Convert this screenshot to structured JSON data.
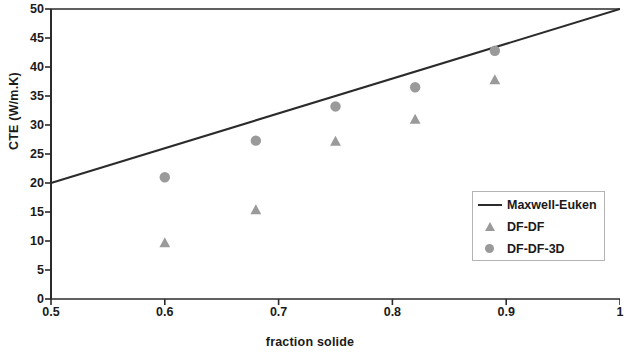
{
  "chart_data": {
    "type": "scatter",
    "title": "",
    "xlabel": "fraction solide",
    "ylabel": "CTE (W/m.K)",
    "xlim": [
      0.5,
      1.0
    ],
    "ylim": [
      0,
      50
    ],
    "xticks": [
      "0.5",
      "0.6",
      "0.7",
      "0.8",
      "0.9",
      "1"
    ],
    "xtick_values": [
      0.5,
      0.6,
      0.7,
      0.8,
      0.9,
      1.0
    ],
    "yticks": [
      "0",
      "5",
      "10",
      "15",
      "20",
      "25",
      "30",
      "35",
      "40",
      "45",
      "50"
    ],
    "ytick_values": [
      0,
      5,
      10,
      15,
      20,
      25,
      30,
      35,
      40,
      45,
      50
    ],
    "grid": false,
    "legend_position": "lower right",
    "series": [
      {
        "name": "Maxwell-Euken",
        "marker": "line",
        "color": "#2b2b2b",
        "x": [
          0.5,
          1.0
        ],
        "values": [
          20.0,
          50.0
        ]
      },
      {
        "name": "DF-DF",
        "marker": "triangle",
        "color": "#9a9a9a",
        "x": [
          0.6,
          0.68,
          0.75,
          0.82,
          0.89
        ],
        "values": [
          9.7,
          15.4,
          27.2,
          31.0,
          37.8
        ]
      },
      {
        "name": "DF-DF-3D",
        "marker": "circle",
        "color": "#9a9a9a",
        "x": [
          0.6,
          0.68,
          0.75,
          0.82,
          0.89
        ],
        "values": [
          21.0,
          27.3,
          33.2,
          36.5,
          42.8
        ]
      }
    ]
  },
  "legend": {
    "items": [
      {
        "label": "Maxwell-Euken",
        "symbol": "line-swatch"
      },
      {
        "label": "DF-DF",
        "symbol": "triangle-marker"
      },
      {
        "label": "DF-DF-3D",
        "symbol": "circle-marker"
      }
    ]
  },
  "colors": {
    "axis": "#2b2b2b",
    "line": "#2b2b2b",
    "marker": "#9a9a9a",
    "legend_border": "#b4b4b4",
    "background": "#ffffff"
  }
}
